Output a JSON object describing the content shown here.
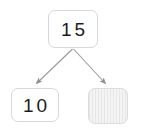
{
  "diagram": {
    "type": "binary-tree",
    "background_color": "#ffffff",
    "node_border_color": "#d8d8d8",
    "node_fill_color": "#ffffff",
    "text_color": "#1c1c1c",
    "edge_color": "#9a9a9a",
    "nodes": [
      {
        "id": "root",
        "label": "15",
        "role": "parent",
        "filled": true
      },
      {
        "id": "left",
        "label": "10",
        "role": "child-left",
        "filled": true
      },
      {
        "id": "right",
        "label": "",
        "role": "child-right",
        "filled": false,
        "placeholder": true
      }
    ],
    "edges": [
      {
        "from": "root",
        "to": "left",
        "arrow": true
      },
      {
        "from": "root",
        "to": "right",
        "arrow": true
      }
    ]
  }
}
